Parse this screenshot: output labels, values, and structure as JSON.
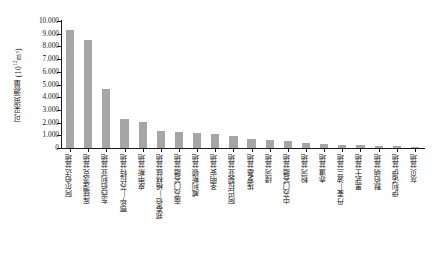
{
  "chart_data": {
    "type": "bar",
    "title": "",
    "xlabel": "",
    "ylabel": "可采资源量 (10¹²m³)",
    "ylabel_main": "可采资源量 (10",
    "ylabel_exp": "12",
    "ylabel_tail": "m³)",
    "ylim": [
      0,
      10.0
    ],
    "ytick_labels": [
      "10.000",
      "9.000",
      "8.000",
      "7.000",
      "6.000",
      "5.000",
      "4.000",
      "3.000",
      "2.000",
      "1.000",
      "0"
    ],
    "ytick_values": [
      10.0,
      9.0,
      8.0,
      7.0,
      6.0,
      5.0,
      4.0,
      3.0,
      2.0,
      1.0,
      0
    ],
    "grid": false,
    "legend": "none",
    "bar_color": "#a6a6a6",
    "axis_color": "#1c1c1c",
    "categories": [
      "阿尔伯达盆地",
      "库兹涅茨克盆地",
      "东西伯利亚盆地",
      "鄂毕—苏拉特盆地",
      "皮申斯盆地",
      "郑泰伯—格林兹盆地",
      "南苏门答腊盆地",
      "威利斯顿盆地",
      "圣明安盆地",
      "阿巴拉契亚盆地",
      "埃罗基盆地",
      "绿河盆地",
      "中苏门答腊盆地",
      "粉河盆地",
      "赤道盆地",
      "丹麦—波兰盆地",
      "黑武士盆地",
      "默伯纳盆地",
      "伊利诺伊盆地",
      "灰贝盆地"
    ],
    "values": [
      9.3,
      8.48,
      4.63,
      2.3,
      2.05,
      1.35,
      1.25,
      1.22,
      1.1,
      0.95,
      0.72,
      0.62,
      0.55,
      0.4,
      0.31,
      0.25,
      0.2,
      0.17,
      0.14,
      0.1
    ]
  }
}
